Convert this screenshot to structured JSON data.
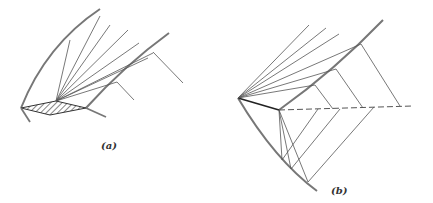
{
  "figure": {
    "panels": [
      {
        "id": "a",
        "label": "(a)",
        "description": "Fan of lines from a hatched rhombic region bounded by two curved arcs"
      },
      {
        "id": "b",
        "label": "(b)",
        "description": "Fan of lines from a corner point, with a dashed reference line and lines projecting between two curved arcs"
      }
    ]
  },
  "colors": {
    "line": "#555555",
    "arc": "#777777",
    "background": "#ffffff"
  }
}
